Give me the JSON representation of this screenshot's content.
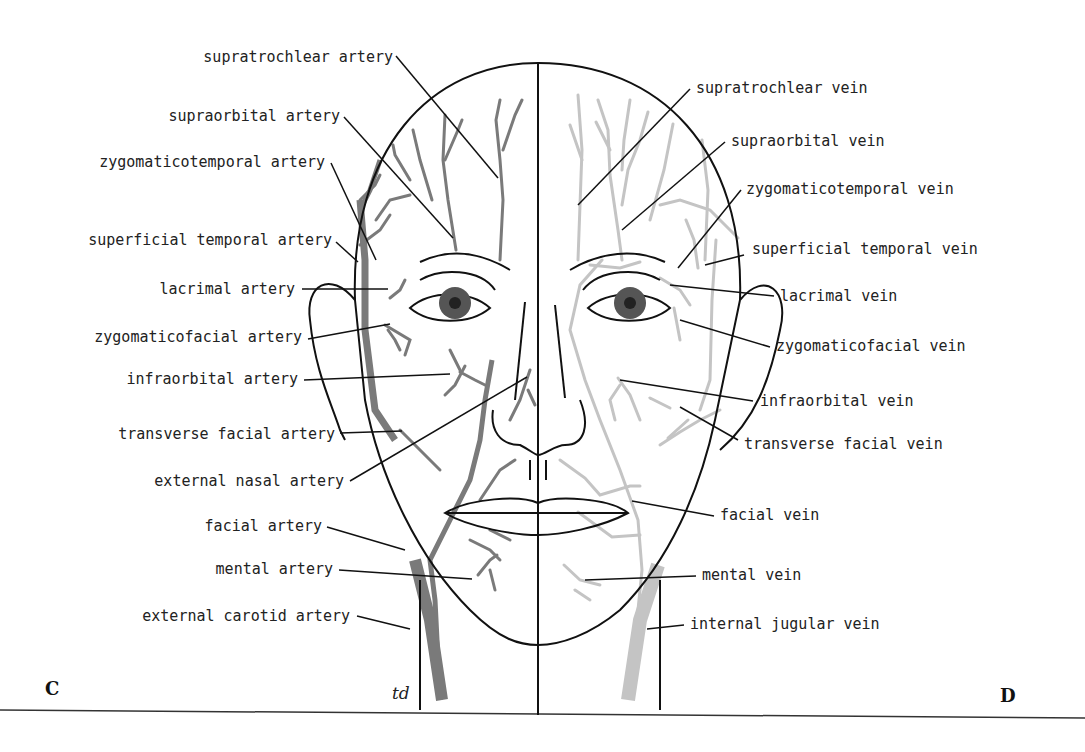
{
  "figure": {
    "panel_left": "C",
    "panel_right": "D",
    "signature": "td",
    "colors": {
      "outline": "#111111",
      "artery": "#7a7a7a",
      "vein": "#c4c4c4",
      "iris": "#555555"
    }
  },
  "artery_labels": [
    {
      "text": "supratrochlear artery",
      "x": 393,
      "y": 59
    },
    {
      "text": "supraorbital artery",
      "x": 340,
      "y": 118
    },
    {
      "text": "zygomaticotemporal artery",
      "x": 326,
      "y": 163
    },
    {
      "text": "superficial temporal artery",
      "x": 332,
      "y": 241
    },
    {
      "text": "lacrimal artery",
      "x": 295,
      "y": 290
    },
    {
      "text": "zygomaticofacial artery",
      "x": 302,
      "y": 338
    },
    {
      "text": "infraorbital artery",
      "x": 298,
      "y": 380
    },
    {
      "text": "transverse facial artery",
      "x": 335,
      "y": 435
    },
    {
      "text": "external nasal artery",
      "x": 344,
      "y": 482
    },
    {
      "text": "facial artery",
      "x": 322,
      "y": 527
    },
    {
      "text": "mental artery",
      "x": 333,
      "y": 570
    },
    {
      "text": "external carotid artery",
      "x": 350,
      "y": 617
    }
  ],
  "vein_labels": [
    {
      "text": "supratrochlear vein",
      "x": 696,
      "y": 89
    },
    {
      "text": "supraorbital vein",
      "x": 731,
      "y": 142
    },
    {
      "text": "zygomaticotemporal vein",
      "x": 746,
      "y": 190
    },
    {
      "text": "superficial temporal vein",
      "x": 752,
      "y": 249
    },
    {
      "text": "lacrimal vein",
      "x": 780,
      "y": 296
    },
    {
      "text": "zygomaticofacial vein",
      "x": 776,
      "y": 347
    },
    {
      "text": "infraorbital vein",
      "x": 760,
      "y": 402
    },
    {
      "text": "transverse facial vein",
      "x": 744,
      "y": 444
    },
    {
      "text": "facial vein",
      "x": 720,
      "y": 515
    },
    {
      "text": "mental vein",
      "x": 702,
      "y": 576
    },
    {
      "text": "internal jugular vein",
      "x": 690,
      "y": 625
    }
  ]
}
